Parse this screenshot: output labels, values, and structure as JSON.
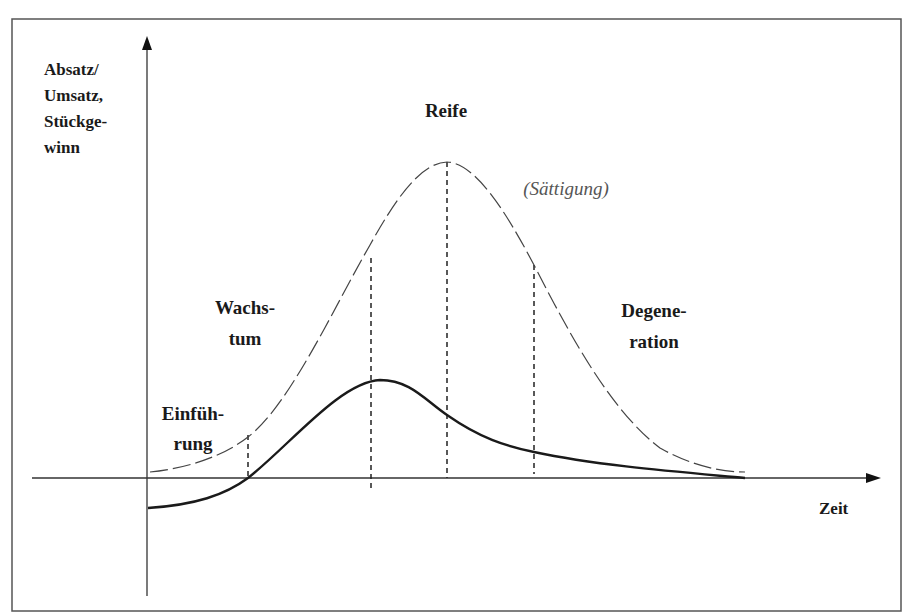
{
  "diagram": {
    "y_axis_label": [
      "Absatz/",
      "Umsatz,",
      "Stückge-",
      "winn"
    ],
    "x_axis_label": "Zeit",
    "phases": [
      {
        "name": "einfuehrung",
        "lines": [
          "Einfüh-",
          "rung"
        ]
      },
      {
        "name": "wachstum",
        "lines": [
          "Wachs-",
          "tum"
        ]
      },
      {
        "name": "reife",
        "lines": [
          "Reife"
        ]
      },
      {
        "name": "saettigung",
        "lines": [
          "(Sättigung)"
        ]
      },
      {
        "name": "degeneration",
        "lines": [
          "Degene-",
          "ration"
        ]
      }
    ],
    "curves": [
      {
        "name": "absatz-umsatz-curve",
        "style": "dashed",
        "description": "Absatz/Umsatz"
      },
      {
        "name": "stueckgewinn-curve",
        "style": "solid",
        "description": "Stückgewinn"
      }
    ],
    "phase_boundaries": 4,
    "colors": {
      "line": "#333333",
      "text": "#1a1a1a",
      "muted_text": "#555555",
      "frame": "#555555"
    }
  }
}
